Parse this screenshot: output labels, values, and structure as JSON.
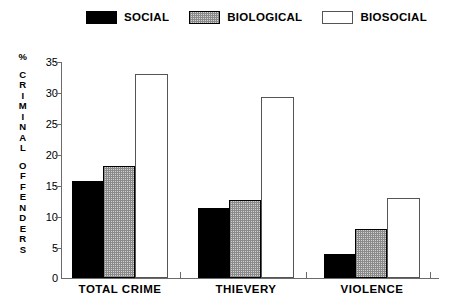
{
  "legend": {
    "entries": [
      {
        "label": "SOCIAL",
        "swatch": "social-swatch",
        "color": "#000000"
      },
      {
        "label": "BIOLOGICAL",
        "swatch": "biological-swatch",
        "color": "#b0b0b0"
      },
      {
        "label": "BIOSOCIAL",
        "swatch": "biosocial-swatch",
        "color": "#ffffff"
      }
    ]
  },
  "axis": {
    "y_title_lines": [
      "%",
      "C",
      "R",
      "I",
      "M",
      "I",
      "N",
      "A",
      "L",
      "",
      "O",
      "F",
      "F",
      "E",
      "N",
      "D",
      "E",
      "R",
      "S"
    ],
    "y_ticks": [
      "35",
      "30",
      "25",
      "20",
      "15",
      "10",
      "5",
      "0"
    ]
  },
  "chart_data": {
    "type": "bar",
    "title": "",
    "subtitle": "",
    "xlabel": "",
    "ylabel": "% CRIMINAL OFFENDERS",
    "ylim": [
      0,
      35
    ],
    "yticks": [
      0,
      5,
      10,
      15,
      20,
      25,
      30,
      35
    ],
    "grid": false,
    "legend_position": "top",
    "categories": [
      "TOTAL CRIME",
      "THIEVERY",
      "VIOLENCE"
    ],
    "series": [
      {
        "name": "SOCIAL",
        "color": "#000000",
        "values": [
          15.7,
          11.4,
          3.9
        ]
      },
      {
        "name": "BIOLOGICAL",
        "color": "#b0b0b0",
        "values": [
          18.1,
          12.6,
          8.0
        ]
      },
      {
        "name": "BIOSOCIAL",
        "color": "#ffffff",
        "values": [
          33.0,
          29.4,
          13.0
        ]
      }
    ]
  }
}
